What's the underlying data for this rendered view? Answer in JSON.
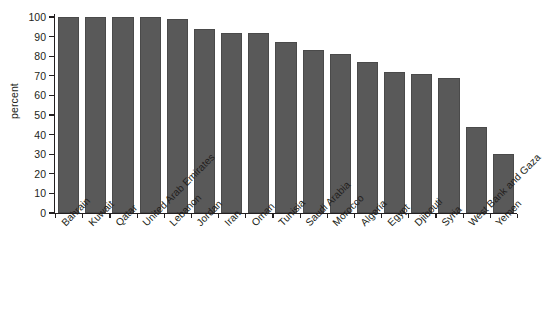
{
  "chart_data": {
    "type": "bar",
    "title": "",
    "subtitle": "",
    "xlabel": "",
    "ylabel": "percent",
    "ylim": [
      0,
      100
    ],
    "grid": false,
    "legend": null,
    "orientation": "vertical",
    "bar_color": "#595959",
    "axis_color": "#231f20",
    "ytick_labels": [
      "100",
      "90",
      "80",
      "70",
      "60",
      "50",
      "40",
      "30",
      "20",
      "10",
      "0"
    ],
    "ytick_values": [
      100,
      90,
      80,
      70,
      60,
      50,
      40,
      30,
      20,
      10,
      0
    ],
    "categories": [
      "Bahrain",
      "Kuwait",
      "Qatar",
      "United Arab Emirates",
      "Lebanon",
      "Jordan",
      "Iran",
      "Oman",
      "Tunisia",
      "Saudi Arabia",
      "Morocco",
      "Algeria",
      "Egypt",
      "Djibouti",
      "Syria",
      "West Bank and Gaza",
      "Yemen"
    ],
    "values": [
      100,
      100,
      100,
      100,
      99,
      94,
      92,
      92,
      87,
      83,
      81,
      77,
      72,
      71,
      69,
      44,
      30
    ]
  }
}
